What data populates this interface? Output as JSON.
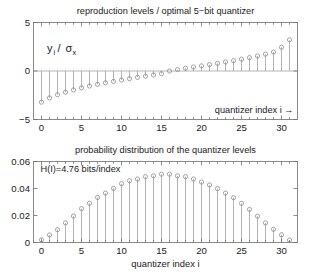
{
  "figure": {
    "background": "#ffffff",
    "axis_color": "#6e6e6e",
    "stem_color": "#9a9a9a",
    "marker_color": "#8d8d8d"
  },
  "chart_data": [
    {
      "type": "scatter",
      "plot_name": "reproduction-levels",
      "title": "reproduction levels / optimal 5−bit quantizer",
      "xlabel": "",
      "ylabel": "y_i / σ_x",
      "ylabel_parts": {
        "base": "y",
        "sub1": "i",
        "slash": " / ",
        "sigma": "σ",
        "sub2": "x"
      },
      "annotation": "quantizer index  i →",
      "xlim": [
        -1,
        32
      ],
      "ylim": [
        -5,
        5
      ],
      "xticks": [
        0,
        5,
        10,
        15,
        20,
        25,
        30
      ],
      "xticklabels": [
        "0",
        "5",
        "10",
        "15",
        "20",
        "25",
        "30"
      ],
      "yticks": [
        -5,
        0,
        5
      ],
      "yticklabels": [
        "−5",
        "0",
        "5"
      ],
      "grid": false,
      "stem_baseline": 0,
      "x": [
        0,
        1,
        2,
        3,
        4,
        5,
        6,
        7,
        8,
        9,
        10,
        11,
        12,
        13,
        14,
        15,
        16,
        17,
        18,
        19,
        20,
        21,
        22,
        23,
        24,
        25,
        26,
        27,
        28,
        29,
        30,
        31
      ],
      "values": [
        -3.21,
        -2.78,
        -2.45,
        -2.18,
        -1.95,
        -1.74,
        -1.55,
        -1.38,
        -1.22,
        -1.07,
        -0.93,
        -0.79,
        -0.66,
        -0.53,
        -0.41,
        -0.28,
        0.0,
        0.14,
        0.28,
        0.41,
        0.53,
        0.66,
        0.79,
        0.93,
        1.07,
        1.22,
        1.38,
        1.55,
        1.74,
        1.95,
        2.45,
        3.21
      ]
    },
    {
      "type": "scatter",
      "plot_name": "probability-distribution",
      "title": "probability distribution of the  quantizer levels",
      "xlabel": "quantizer index  i",
      "ylabel": "",
      "annotation": "H(I)=4.76 bits/index",
      "xlim": [
        -1,
        32
      ],
      "ylim": [
        0,
        0.06
      ],
      "xticks": [
        0,
        5,
        10,
        15,
        20,
        25,
        30
      ],
      "xticklabels": [
        "0",
        "5",
        "10",
        "15",
        "20",
        "25",
        "30"
      ],
      "yticks": [
        0,
        0.02,
        0.04,
        0.06
      ],
      "yticklabels": [
        "0",
        "0.02",
        "0.04",
        "0.06"
      ],
      "grid": false,
      "stem_baseline": 0,
      "x": [
        0,
        1,
        2,
        3,
        4,
        5,
        6,
        7,
        8,
        9,
        10,
        11,
        12,
        13,
        14,
        15,
        16,
        17,
        18,
        19,
        20,
        21,
        22,
        23,
        24,
        25,
        26,
        27,
        28,
        29,
        30,
        31
      ],
      "values": [
        0.002,
        0.0056,
        0.0095,
        0.0145,
        0.0196,
        0.0251,
        0.0291,
        0.0334,
        0.0366,
        0.0401,
        0.0436,
        0.0458,
        0.047,
        0.0488,
        0.0494,
        0.0506,
        0.0506,
        0.0494,
        0.0488,
        0.047,
        0.0448,
        0.0426,
        0.0399,
        0.0366,
        0.0332,
        0.029,
        0.0245,
        0.0195,
        0.0145,
        0.0098,
        0.0057,
        0.0018
      ]
    }
  ]
}
